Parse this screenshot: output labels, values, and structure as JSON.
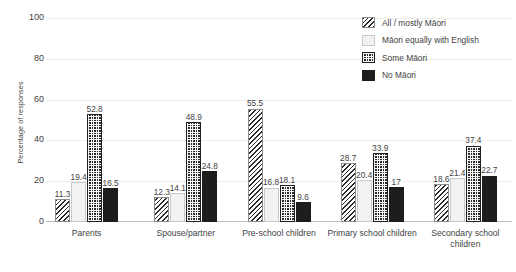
{
  "chart_data": {
    "type": "bar",
    "title": "",
    "subtitle": "",
    "xlabel": "",
    "ylabel": "Percentage of responses",
    "ylim": [
      0,
      100
    ],
    "yticks": [
      0,
      20,
      40,
      60,
      80,
      100
    ],
    "ytick_labels": [
      "0",
      "20",
      "40",
      "60",
      "80",
      "100"
    ],
    "grid": true,
    "grid_axis": "y",
    "legend_position": "top-right",
    "categories": [
      "Parents",
      "Spouse/partner",
      "Pre-school children",
      "Primary school children",
      "Secondary school children"
    ],
    "series": [
      {
        "name": "All / mostly Māori",
        "pattern": "diagonal-hatch",
        "color": "#2b2b2b",
        "values": [
          11.3,
          12.3,
          55.5,
          28.7,
          18.6
        ],
        "labels": [
          "11.3",
          "12.3",
          "55.5",
          "28.7",
          "18.6"
        ]
      },
      {
        "name": "Māori equally with English",
        "pattern": "light-solid",
        "color": "#f2f2f2",
        "values": [
          19.4,
          14.1,
          16.8,
          20.4,
          21.4
        ],
        "labels": [
          "19.4",
          "14.1",
          "16.8",
          "20.4",
          "21.4"
        ]
      },
      {
        "name": "Some Māori",
        "pattern": "checkerboard",
        "color": "#2b2b2b",
        "values": [
          52.8,
          48.9,
          18.1,
          33.9,
          37.4
        ],
        "labels": [
          "52.8",
          "48.9",
          "18.1",
          "33.9",
          "37.4"
        ]
      },
      {
        "name": "No Māori",
        "pattern": "solid-dark",
        "color": "#1d1d1d",
        "values": [
          16.5,
          24.8,
          9.6,
          17.0,
          22.7
        ],
        "labels": [
          "16.5",
          "24.8",
          "9.6",
          "17",
          "22.7"
        ]
      }
    ]
  }
}
